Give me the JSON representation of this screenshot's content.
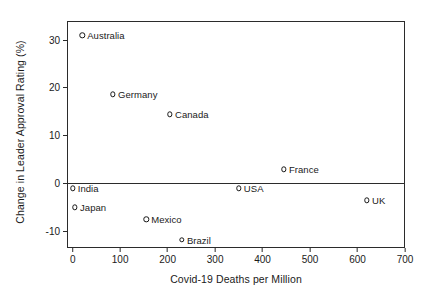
{
  "chart_data": {
    "type": "scatter",
    "title": "",
    "xlabel": "Covid-19 Deaths per Million",
    "ylabel": "Change in Leader Approval Rating (%)",
    "xlim": [
      -12,
      700
    ],
    "ylim": [
      -13.5,
      34
    ],
    "xticks": [
      0,
      100,
      200,
      300,
      400,
      500,
      600,
      700
    ],
    "xticklabels": [
      "0",
      "100",
      "200",
      "300",
      "400",
      "500",
      "600",
      "700"
    ],
    "yticks": [
      -10,
      0,
      10,
      20,
      30
    ],
    "yticklabels": [
      "-10",
      "0",
      "10",
      "20",
      "30"
    ],
    "grid": false,
    "legend": "none",
    "reference_lines": [
      {
        "axis": "y",
        "value": 0
      }
    ],
    "points": [
      {
        "label": "Australia",
        "x": 20,
        "y": 31.0
      },
      {
        "label": "Germany",
        "x": 85,
        "y": 18.7
      },
      {
        "label": "Canada",
        "x": 205,
        "y": 14.5
      },
      {
        "label": "France",
        "x": 445,
        "y": 3.0
      },
      {
        "label": "USA",
        "x": 350,
        "y": -1.0
      },
      {
        "label": "India",
        "x": 0,
        "y": -1.0
      },
      {
        "label": "UK",
        "x": 620,
        "y": -3.5
      },
      {
        "label": "Japan",
        "x": 5,
        "y": -5.0
      },
      {
        "label": "Mexico",
        "x": 155,
        "y": -7.5
      },
      {
        "label": "Brazil",
        "x": 230,
        "y": -11.8
      }
    ]
  }
}
